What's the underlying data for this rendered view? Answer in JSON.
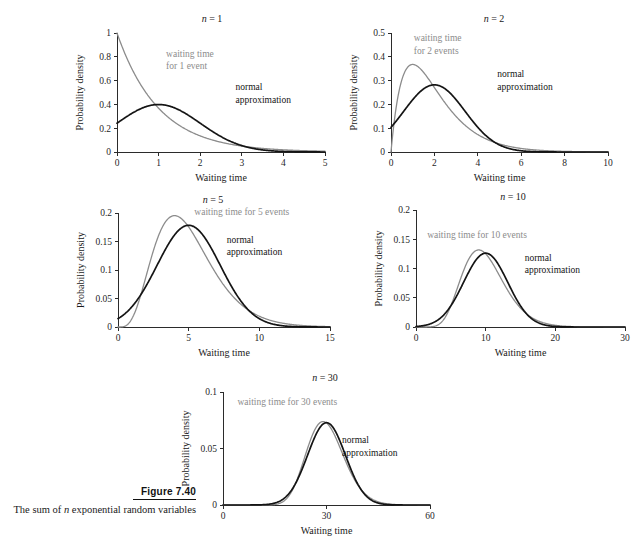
{
  "figure": {
    "number_label": "Figure 7.40",
    "caption_line_1_a": "The sum of ",
    "caption_line_1_italic": "n",
    "caption_line_1_b": " exponential random",
    "caption_line_2": "variables"
  },
  "labels": {
    "xlabel": "Waiting time",
    "ylabel": "Probability density",
    "normal_line1": "normal",
    "normal_line2": "approximation"
  },
  "chart_data": [
    {
      "id": "panel-n1",
      "type": "line",
      "title": "n = 1",
      "title_var": "n",
      "title_rest": " = 1",
      "n": 1,
      "xlabel": "Waiting time",
      "ylabel": "Probability density",
      "xlim": [
        0,
        5
      ],
      "ylim": [
        0,
        1
      ],
      "xticks": [
        0,
        1,
        2,
        3,
        4,
        5
      ],
      "xticklabels": [
        "0",
        "1",
        "2",
        "3",
        "4",
        "5"
      ],
      "yticks": [
        0,
        0.2,
        0.4,
        0.6,
        0.8,
        1
      ],
      "yticklabels": [
        "0",
        "0.2",
        "0.4",
        "0.6",
        "0.8",
        "1"
      ],
      "grid": false,
      "legend": "inline-annotations",
      "series": [
        {
          "name": "waiting time for 1 event",
          "kind": "gamma",
          "shape": 1,
          "rate": 1,
          "color": "#8c8c8c",
          "annotation_lines": [
            "waiting time",
            "for 1 event"
          ],
          "annotation_pos": [
            1.18,
            0.8
          ]
        },
        {
          "name": "normal approximation",
          "kind": "normal",
          "mean": 1,
          "sd": 1,
          "color": "#141414",
          "annotation_lines": [
            "normal",
            "approximation"
          ],
          "annotation_pos": [
            2.85,
            0.52
          ]
        }
      ]
    },
    {
      "id": "panel-n2",
      "type": "line",
      "title": "n = 2",
      "title_var": "n",
      "title_rest": " = 2",
      "n": 2,
      "xlabel": "Waiting time",
      "ylabel": "Probability density",
      "xlim": [
        0,
        10
      ],
      "ylim": [
        0,
        0.5
      ],
      "xticks": [
        0,
        2,
        4,
        6,
        8,
        10
      ],
      "xticklabels": [
        "0",
        "2",
        "4",
        "6",
        "8",
        "10"
      ],
      "yticks": [
        0,
        0.1,
        0.2,
        0.3,
        0.4,
        0.5
      ],
      "yticklabels": [
        "0",
        "0.1",
        "0.2",
        "0.3",
        "0.4",
        "0.5"
      ],
      "grid": false,
      "legend": "inline-annotations",
      "series": [
        {
          "name": "waiting time for 2 events",
          "kind": "gamma",
          "shape": 2,
          "rate": 1,
          "color": "#8c8c8c",
          "annotation_lines": [
            "waiting time",
            "for 2 events"
          ],
          "annotation_pos": [
            1.05,
            0.465
          ]
        },
        {
          "name": "normal approximation",
          "kind": "normal",
          "mean": 2,
          "sd": 1.4142,
          "color": "#141414",
          "annotation_lines": [
            "normal",
            "approximation"
          ],
          "annotation_pos": [
            4.9,
            0.315
          ]
        }
      ]
    },
    {
      "id": "panel-n5",
      "type": "line",
      "title": "n = 5",
      "title_var": "n",
      "title_rest": " = 5",
      "n": 5,
      "xlabel": "Waiting time",
      "ylabel": "Probability density",
      "xlim": [
        0,
        15
      ],
      "ylim": [
        0,
        0.2
      ],
      "xticks": [
        0,
        5,
        10,
        15
      ],
      "xticklabels": [
        "0",
        "5",
        "10",
        "15"
      ],
      "yticks": [
        0,
        0.05,
        0.1,
        0.15,
        0.2
      ],
      "yticklabels": [
        "0",
        "0.05",
        "0.1",
        "0.15",
        "0.2"
      ],
      "grid": false,
      "legend": "inline-annotations",
      "series": [
        {
          "name": "waiting time for 5 events",
          "kind": "gamma",
          "shape": 5,
          "rate": 1,
          "color": "#8c8c8c",
          "annotation_lines": [
            "waiting time for 5 events"
          ],
          "annotation_pos": [
            5.4,
            0.197
          ]
        },
        {
          "name": "normal approximation",
          "kind": "normal",
          "mean": 5,
          "sd": 2.2361,
          "color": "#141414",
          "annotation_lines": [
            "normal",
            "approximation"
          ],
          "annotation_pos": [
            7.7,
            0.148
          ]
        }
      ]
    },
    {
      "id": "panel-n10",
      "type": "line",
      "title": "n = 10",
      "title_var": "n",
      "title_rest": " = 10",
      "n": 10,
      "xlabel": "Waiting time",
      "ylabel": "Probability density",
      "xlim": [
        0,
        30
      ],
      "ylim": [
        0,
        0.2
      ],
      "xticks": [
        0,
        10,
        20,
        30
      ],
      "xticklabels": [
        "0",
        "10",
        "20",
        "30"
      ],
      "yticks": [
        0,
        0.05,
        0.1,
        0.15,
        0.2
      ],
      "yticklabels": [
        "0",
        "0.05",
        "0.1",
        "0.15",
        "0.2"
      ],
      "grid": false,
      "legend": "inline-annotations",
      "series": [
        {
          "name": "waiting time for 10 events",
          "kind": "gamma",
          "shape": 10,
          "rate": 1,
          "color": "#8c8c8c",
          "annotation_lines": [
            "waiting time for 10 events"
          ],
          "annotation_pos": [
            1.6,
            0.152
          ]
        },
        {
          "name": "normal approximation",
          "kind": "normal",
          "mean": 10,
          "sd": 3.1623,
          "color": "#141414",
          "annotation_lines": [
            "normal",
            "approximation"
          ],
          "annotation_pos": [
            15.6,
            0.113
          ]
        }
      ]
    },
    {
      "id": "panel-n30",
      "type": "line",
      "title": "n = 30",
      "title_var": "n",
      "title_rest": " = 30",
      "n": 30,
      "xlabel": "Waiting time",
      "ylabel": "Probability density",
      "xlim": [
        0,
        60
      ],
      "ylim": [
        0,
        0.1
      ],
      "xticks": [
        0,
        30,
        60
      ],
      "xticklabels": [
        "0",
        "30",
        "60"
      ],
      "yticks": [
        0,
        0.05,
        0.1
      ],
      "yticklabels": [
        "0",
        "0.05",
        "0.1"
      ],
      "grid": false,
      "legend": "inline-annotations",
      "series": [
        {
          "name": "waiting time for 30 events",
          "kind": "gamma",
          "shape": 30,
          "rate": 1,
          "color": "#8c8c8c",
          "annotation_lines": [
            "waiting time for 30 events"
          ],
          "annotation_pos": [
            4.2,
            0.0885
          ]
        },
        {
          "name": "normal approximation",
          "kind": "normal",
          "mean": 30,
          "sd": 5.4772,
          "color": "#141414",
          "annotation_lines": [
            "normal",
            "approximation"
          ],
          "annotation_pos": [
            34.5,
            0.0545
          ]
        }
      ]
    }
  ],
  "panel_geometry": [
    {
      "id": "panel-n1",
      "x0": 117,
      "x1": 325,
      "y0": 152,
      "y1": 33,
      "title_x": 212,
      "title_y": 22
    },
    {
      "id": "panel-n2",
      "x0": 391,
      "x1": 608,
      "y0": 152,
      "y1": 33,
      "title_x": 494,
      "title_y": 22
    },
    {
      "id": "panel-n5",
      "x0": 118,
      "x1": 330,
      "y0": 327,
      "y1": 213,
      "title_x": 213,
      "title_y": 203
    },
    {
      "id": "panel-n10",
      "x0": 416,
      "x1": 625,
      "y0": 327,
      "y1": 210,
      "title_x": 513,
      "title_y": 200
    },
    {
      "id": "panel-n30",
      "x0": 223,
      "x1": 430,
      "y0": 505,
      "y1": 392,
      "title_x": 325,
      "title_y": 381
    }
  ]
}
